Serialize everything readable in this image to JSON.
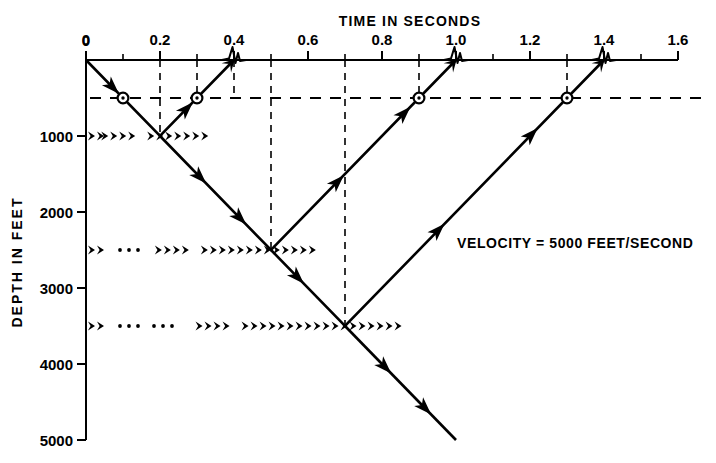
{
  "figure": {
    "caption_note": "",
    "velocity_label": "VELOCITY = 5000 FEET/SECOND"
  },
  "x_axis": {
    "title": "TIME IN SECONDS",
    "min": 0,
    "max": 1.6,
    "tick_step": 0.1,
    "labeled_ticks": [
      "0",
      "0.2",
      "0.4",
      "0.6",
      "0.8",
      "1.0",
      "1.2",
      "1.4",
      "1.6"
    ],
    "labeled_tick_values": [
      0,
      0.2,
      0.4,
      0.6,
      0.8,
      1.0,
      1.2,
      1.4,
      1.6
    ]
  },
  "y_axis": {
    "title": "DEPTH IN FEET",
    "min": 0,
    "max": 5000,
    "tick_step": 1000,
    "labeled_ticks": [
      "0",
      "1000",
      "2000",
      "3000",
      "4000",
      "5000"
    ],
    "labeled_tick_values": [
      0,
      1000,
      2000,
      3000,
      4000,
      5000
    ]
  },
  "chart_data": {
    "type": "line",
    "xlabel": "TIME IN SECONDS",
    "ylabel": "DEPTH IN FEET",
    "xlim": [
      0,
      1.6
    ],
    "ylim": [
      0,
      5000
    ],
    "grid": "dashed verticals at selected times; dashed horizontal receiver line at 500 ft",
    "legend": "none",
    "annotations": [
      "VELOCITY = 5000 FEET/SECOND"
    ],
    "velocity_ft_per_s": 5000,
    "reflectors": [
      {
        "depth": 1000,
        "time_start": 0.0,
        "time_end": 0.32,
        "label": "interface-1000"
      },
      {
        "depth": 2500,
        "time_start": 0.0,
        "time_end": 0.61,
        "label": "interface-2500"
      },
      {
        "depth": 3500,
        "time_start": 0.0,
        "time_end": 0.83,
        "label": "interface-3500"
      }
    ],
    "receiver_line_depth": 500,
    "receivers": [
      {
        "time": 0.1,
        "depth": 500
      },
      {
        "time": 0.3,
        "depth": 500
      },
      {
        "time": 0.9,
        "depth": 500
      },
      {
        "time": 1.3,
        "depth": 500
      }
    ],
    "wavelet_arrivals": [
      {
        "time": 0.4,
        "depth": 0
      },
      {
        "time": 1.0,
        "depth": 0
      },
      {
        "time": 1.4,
        "depth": 0
      }
    ],
    "series": [
      {
        "name": "ray-1000ft-reflection",
        "points": [
          [
            0.0,
            0
          ],
          [
            0.2,
            1000
          ],
          [
            0.4,
            0
          ]
        ]
      },
      {
        "name": "ray-2500ft-reflection",
        "points": [
          [
            0.2,
            1000
          ],
          [
            0.5,
            2500
          ],
          [
            1.0,
            0
          ]
        ]
      },
      {
        "name": "ray-3500ft-reflection",
        "points": [
          [
            0.5,
            2500
          ],
          [
            0.7,
            3500
          ],
          [
            1.4,
            0
          ]
        ]
      },
      {
        "name": "ray-transmitted-downgoing",
        "points": [
          [
            0.7,
            3500
          ],
          [
            1.0,
            5000
          ]
        ]
      }
    ],
    "dashed_verticals": [
      0.2,
      0.3,
      0.4,
      0.5,
      0.7,
      0.9,
      1.3
    ]
  }
}
